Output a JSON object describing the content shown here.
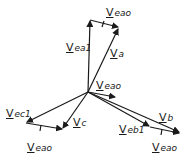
{
  "diagram": {
    "stroke_color": "#1a1a1a",
    "background": "#ffffff",
    "labels": {
      "top_veao": {
        "v": "V",
        "sub": "eao"
      },
      "vea1": {
        "v": "V",
        "sub": "ea1"
      },
      "va": {
        "v": "V",
        "sub": "a"
      },
      "center_veao": {
        "v": "V",
        "sub": "eao"
      },
      "vec1": {
        "v": "V",
        "sub": "ec1"
      },
      "vc": {
        "v": "V",
        "sub": "c"
      },
      "bottom_left_veao": {
        "v": "V",
        "sub": "eao"
      },
      "vebl": {
        "v": "V",
        "sub": "eb1"
      },
      "vb": {
        "v": "V",
        "sub": "b"
      },
      "bottom_right_veao": {
        "v": "V",
        "sub": "eao"
      }
    },
    "nodes": {
      "origin": [
        88,
        92
      ],
      "ea1_tip": [
        90,
        20
      ],
      "a_tip": [
        119,
        28
      ],
      "ec1_tip": [
        26,
        123
      ],
      "c_tip": [
        63,
        129
      ],
      "eb1_tip": [
        150,
        127
      ],
      "b_tip": [
        180,
        133
      ],
      "center_eao_tip": [
        115,
        97
      ]
    }
  }
}
